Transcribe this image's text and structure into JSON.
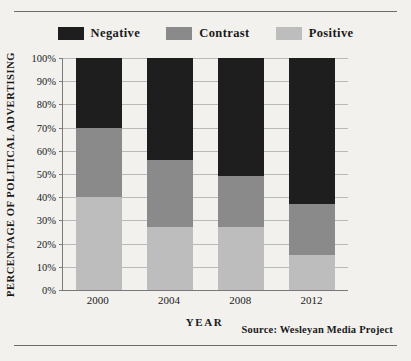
{
  "chart_data": {
    "type": "bar",
    "subtype": "stacked-bar-100pct",
    "title": "",
    "xlabel": "YEAR",
    "ylabel": "PERCENTAGE OF POLITICAL ADVERTISING",
    "categories": [
      "2000",
      "2004",
      "2008",
      "2012"
    ],
    "ylim": [
      0,
      100
    ],
    "ytick_labels": [
      "0%",
      "10%",
      "20%",
      "30%",
      "40%",
      "50%",
      "60%",
      "70%",
      "80%",
      "90%",
      "100%"
    ],
    "ytick_values": [
      0,
      10,
      20,
      30,
      40,
      50,
      60,
      70,
      80,
      90,
      100
    ],
    "grid": true,
    "legend_position": "top-center",
    "stack_order_bottom_to_top": [
      "Positive",
      "Contrast",
      "Negative"
    ],
    "series": [
      {
        "name": "Negative",
        "color": "#1e1e1e",
        "values": [
          30,
          44,
          51,
          63
        ]
      },
      {
        "name": "Contrast",
        "color": "#8a8a8a",
        "values": [
          30,
          29,
          22,
          22
        ]
      },
      {
        "name": "Positive",
        "color": "#bdbdbd",
        "values": [
          40,
          27,
          27,
          15
        ]
      }
    ],
    "cumulative_boundaries_pct": {
      "2000": [
        40,
        70
      ],
      "2004": [
        27,
        56
      ],
      "2008": [
        27,
        49
      ],
      "2012": [
        15,
        37
      ]
    },
    "source_note": "Source:  Wesleyan Media Project"
  },
  "legend": {
    "items": [
      {
        "label": "Negative",
        "color": "#1e1e1e"
      },
      {
        "label": "Contrast",
        "color": "#8a8a8a"
      },
      {
        "label": "Positive",
        "color": "#bdbdbd"
      }
    ]
  }
}
